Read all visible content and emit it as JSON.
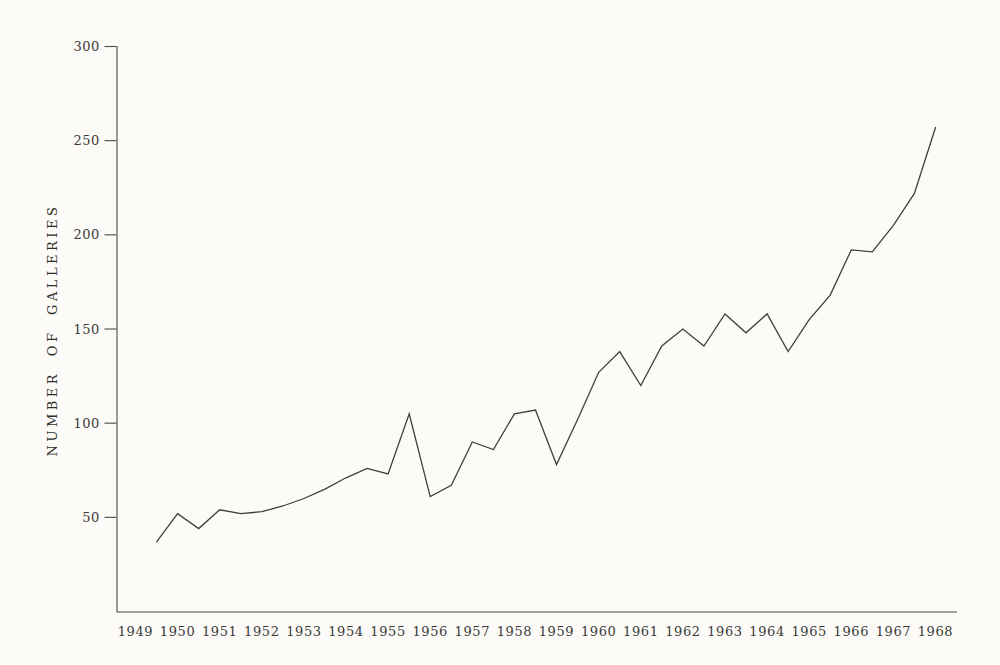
{
  "page": {
    "background_color": "#fcfbf8",
    "ink_color": "#3a3a38"
  },
  "chart_data": {
    "type": "line",
    "title": "",
    "xlabel": "",
    "ylabel": "NUMBER OF GALLERIES",
    "xlim": [
      1949,
      1968
    ],
    "ylim": [
      0,
      300
    ],
    "grid": false,
    "legend": null,
    "y_ticks": [
      50,
      100,
      150,
      200,
      250,
      300
    ],
    "x_tick_labels": [
      "1949",
      "1950",
      "1951",
      "1952",
      "1953",
      "1954",
      "1955",
      "1956",
      "1957",
      "1958",
      "1959",
      "1960",
      "1961",
      "1962",
      "1963",
      "1964",
      "1965",
      "1966",
      "1967",
      "1968"
    ],
    "line_color": "#3f3f3c",
    "series": [
      {
        "name": "galleries",
        "x": [
          1949.5,
          1950.0,
          1950.5,
          1951.0,
          1951.5,
          1952.0,
          1952.5,
          1953.0,
          1953.5,
          1954.0,
          1954.5,
          1955.0,
          1955.5,
          1956.0,
          1956.5,
          1957.0,
          1957.5,
          1958.0,
          1958.5,
          1959.0,
          1959.5,
          1960.0,
          1960.5,
          1961.0,
          1961.5,
          1962.0,
          1962.5,
          1963.0,
          1963.5,
          1964.0,
          1964.5,
          1965.0,
          1965.5,
          1966.0,
          1966.5,
          1967.0,
          1967.5,
          1968.0
        ],
        "values": [
          37,
          52,
          44,
          54,
          52,
          53,
          56,
          60,
          65,
          71,
          76,
          73,
          105,
          61,
          67,
          90,
          86,
          105,
          107,
          78,
          102,
          127,
          138,
          120,
          141,
          150,
          141,
          158,
          148,
          158,
          138,
          155,
          168,
          192,
          191,
          205,
          222,
          257
        ]
      }
    ]
  }
}
